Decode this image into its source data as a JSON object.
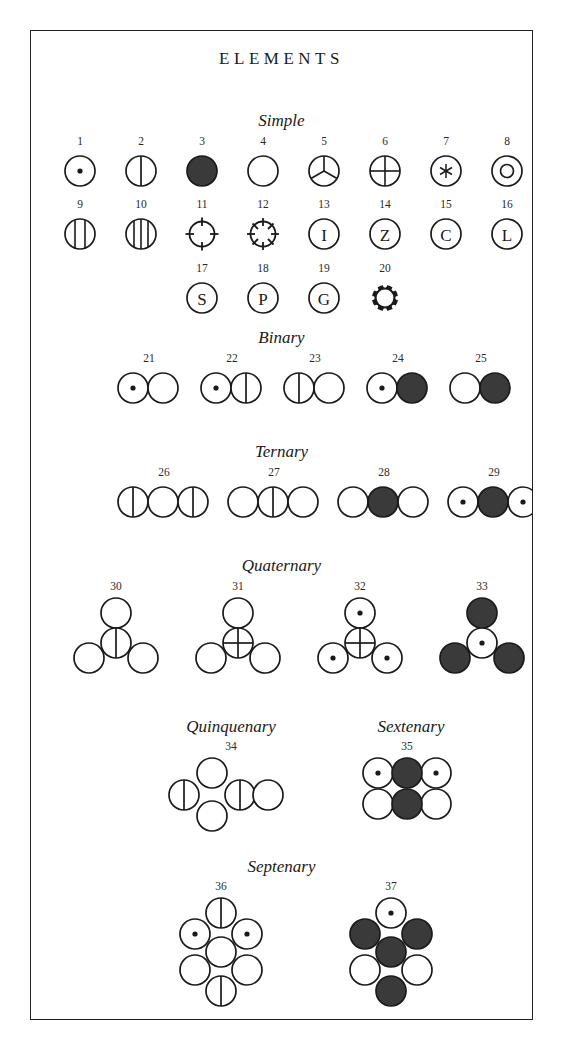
{
  "plate": {
    "title": "ELEMENTS",
    "frame_color": "#222222",
    "fill_dark": "#3a3a3a",
    "background": "#ffffff"
  },
  "sections": [
    {
      "id": "simple",
      "label": "Simple"
    },
    {
      "id": "binary",
      "label": "Binary"
    },
    {
      "id": "ternary",
      "label": "Ternary"
    },
    {
      "id": "quaternary",
      "label": "Quaternary"
    },
    {
      "id": "quinquenary",
      "label": "Quinquenary"
    },
    {
      "id": "sextenary",
      "label": "Sextenary"
    },
    {
      "id": "septenary",
      "label": "Septenary"
    }
  ],
  "elements": [
    {
      "n": "1",
      "section": "simple",
      "glyph": "circle-dot"
    },
    {
      "n": "2",
      "section": "simple",
      "glyph": "circle-vline-1"
    },
    {
      "n": "3",
      "section": "simple",
      "glyph": "circle-filled"
    },
    {
      "n": "4",
      "section": "simple",
      "glyph": "circle-plain"
    },
    {
      "n": "5",
      "section": "simple",
      "glyph": "circle-y-spokes"
    },
    {
      "n": "6",
      "section": "simple",
      "glyph": "circle-cross"
    },
    {
      "n": "7",
      "section": "simple",
      "glyph": "circle-asterisk"
    },
    {
      "n": "8",
      "section": "simple",
      "glyph": "circle-ring"
    },
    {
      "n": "9",
      "section": "simple",
      "glyph": "circle-vline-2"
    },
    {
      "n": "10",
      "section": "simple",
      "glyph": "circle-vline-3"
    },
    {
      "n": "11",
      "section": "simple",
      "glyph": "circle-crosshair"
    },
    {
      "n": "12",
      "section": "simple",
      "glyph": "circle-spokes-8"
    },
    {
      "n": "13",
      "section": "simple",
      "glyph": "circle-letter",
      "letter": "I"
    },
    {
      "n": "14",
      "section": "simple",
      "glyph": "circle-letter",
      "letter": "Z"
    },
    {
      "n": "15",
      "section": "simple",
      "glyph": "circle-letter",
      "letter": "C"
    },
    {
      "n": "16",
      "section": "simple",
      "glyph": "circle-letter",
      "letter": "L"
    },
    {
      "n": "17",
      "section": "simple",
      "glyph": "circle-letter",
      "letter": "S"
    },
    {
      "n": "18",
      "section": "simple",
      "glyph": "circle-letter",
      "letter": "P"
    },
    {
      "n": "19",
      "section": "simple",
      "glyph": "circle-letter",
      "letter": "G"
    },
    {
      "n": "20",
      "section": "simple",
      "glyph": "circle-cog"
    },
    {
      "n": "21",
      "section": "binary",
      "glyph": "pair",
      "parts": [
        "dot",
        "plain"
      ]
    },
    {
      "n": "22",
      "section": "binary",
      "glyph": "pair",
      "parts": [
        "dot",
        "vline"
      ]
    },
    {
      "n": "23",
      "section": "binary",
      "glyph": "pair",
      "parts": [
        "vline",
        "plain"
      ]
    },
    {
      "n": "24",
      "section": "binary",
      "glyph": "pair",
      "parts": [
        "dot",
        "filled"
      ]
    },
    {
      "n": "25",
      "section": "binary",
      "glyph": "pair",
      "parts": [
        "plain",
        "filled"
      ]
    },
    {
      "n": "26",
      "section": "ternary",
      "glyph": "triple",
      "parts": [
        "vline",
        "plain",
        "vline"
      ]
    },
    {
      "n": "27",
      "section": "ternary",
      "glyph": "triple",
      "parts": [
        "plain",
        "vline",
        "plain"
      ]
    },
    {
      "n": "28",
      "section": "ternary",
      "glyph": "triple",
      "parts": [
        "plain",
        "filled",
        "plain"
      ]
    },
    {
      "n": "29",
      "section": "ternary",
      "glyph": "triple",
      "parts": [
        "dot",
        "filled",
        "dot"
      ]
    },
    {
      "n": "30",
      "section": "quaternary",
      "glyph": "quad",
      "parts": {
        "top": "plain",
        "center": "vline",
        "left": "plain",
        "right": "plain"
      }
    },
    {
      "n": "31",
      "section": "quaternary",
      "glyph": "quad",
      "parts": {
        "top": "plain",
        "center": "cross",
        "left": "plain",
        "right": "plain"
      }
    },
    {
      "n": "32",
      "section": "quaternary",
      "glyph": "quad",
      "parts": {
        "top": "dot",
        "center": "cross",
        "left": "dot",
        "right": "dot"
      }
    },
    {
      "n": "33",
      "section": "quaternary",
      "glyph": "quad",
      "parts": {
        "top": "filled",
        "center": "dot",
        "left": "filled",
        "right": "filled"
      }
    },
    {
      "n": "34",
      "section": "quinquenary",
      "glyph": "penta",
      "parts": [
        "vline",
        "plain",
        "plain",
        "vline",
        "plain"
      ]
    },
    {
      "n": "35",
      "section": "sextenary",
      "glyph": "hexa",
      "parts": [
        "dot",
        "filled",
        "dot",
        "plain",
        "filled",
        "plain"
      ]
    },
    {
      "n": "36",
      "section": "septenary",
      "glyph": "hepta",
      "parts": {
        "top": "vline",
        "upper_left": "dot",
        "upper_right": "dot",
        "center": "plain",
        "lower_left": "plain",
        "lower_right": "plain",
        "bottom": "vline"
      }
    },
    {
      "n": "37",
      "section": "septenary",
      "glyph": "hepta",
      "parts": {
        "top": "dot",
        "upper_left": "filled",
        "upper_right": "filled",
        "center": "filled",
        "lower_left": "plain",
        "lower_right": "plain",
        "bottom": "filled"
      }
    }
  ]
}
